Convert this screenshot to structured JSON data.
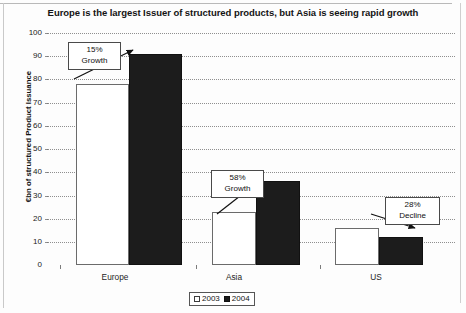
{
  "chart_data": {
    "type": "bar",
    "title": "Europe is the largest Issuer of structured products, but Asia is seeing rapid growth",
    "xlabel": "",
    "ylabel": "€bn of structured Product Issuance",
    "categories": [
      "Europe",
      "Asia",
      "US"
    ],
    "series": [
      {
        "name": "2003",
        "values": [
          78,
          23,
          16
        ]
      },
      {
        "name": "2004",
        "values": [
          91,
          36,
          12
        ]
      }
    ],
    "ylim": [
      0,
      100
    ],
    "yticks": [
      0,
      10,
      20,
      30,
      40,
      50,
      60,
      70,
      80,
      90,
      100
    ],
    "ytick_labels": [
      "0",
      "10",
      "20",
      "30",
      "40",
      "50",
      "60",
      "70",
      "80",
      "90",
      "100"
    ],
    "grid": true,
    "legend_position": "bottom",
    "legend_entries": [
      "2003",
      "2004"
    ],
    "annotations": [
      {
        "category": "Europe",
        "line1": "15%",
        "line2": "Growth"
      },
      {
        "category": "Asia",
        "line1": "58%",
        "line2": "Growth"
      },
      {
        "category": "US",
        "line1": "28%",
        "line2": "Decline"
      }
    ],
    "colors": {
      "series_2003": "#ffffff",
      "series_2004": "#1c1c1c",
      "axis": "#7c7c7c",
      "gridline": "#8f8f8f",
      "text": "#141414"
    }
  }
}
